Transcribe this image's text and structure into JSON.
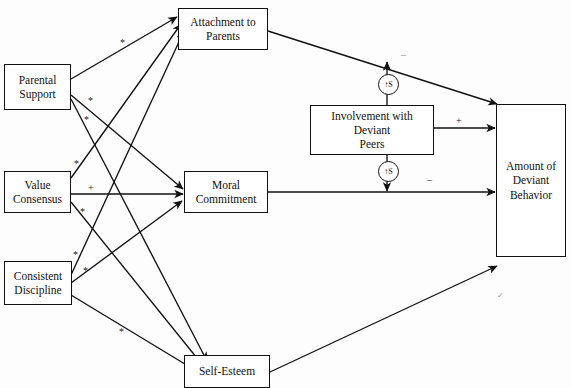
{
  "diagram": {
    "nodes": [
      {
        "id": "parental-support",
        "label": "Parental\nSupport"
      },
      {
        "id": "value-consensus",
        "label": "Value\nConsensus"
      },
      {
        "id": "consistent-discipline",
        "label": "Consistent\nDiscipline"
      },
      {
        "id": "attachment-to-parents",
        "label": "Attachment to\nParents"
      },
      {
        "id": "moral-commitment",
        "label": "Moral\nCommitment"
      },
      {
        "id": "self-esteem",
        "label": "Self-Esteem"
      },
      {
        "id": "involvement-deviant-peers",
        "label": "Involvement with\nDeviant\nPeers"
      },
      {
        "id": "amount-deviant-behavior",
        "label": "Amount of\nDeviant\nBehavior"
      }
    ],
    "edge_labels": [
      {
        "id": "ps-attachment",
        "text": "*"
      },
      {
        "id": "ps-moral",
        "text": "*"
      },
      {
        "id": "ps-selfesteem",
        "text": "*"
      },
      {
        "id": "vc-attachment",
        "text": "*"
      },
      {
        "id": "vc-moral",
        "text": "+"
      },
      {
        "id": "vc-selfesteem",
        "text": "*"
      },
      {
        "id": "cd-attachment",
        "text": "*"
      },
      {
        "id": "cd-moral",
        "text": "*"
      },
      {
        "id": "cd-selfesteem",
        "text": "*"
      },
      {
        "id": "attachment-deviant",
        "text": "–"
      },
      {
        "id": "peers-deviant",
        "text": "+"
      },
      {
        "id": "moral-deviant",
        "text": "–"
      },
      {
        "id": "selfesteem-deviant",
        "text": "✓"
      }
    ],
    "badges": [
      {
        "id": "badge-top",
        "text": "↑S"
      },
      {
        "id": "badge-bottom",
        "text": "↑S"
      }
    ],
    "colors": {
      "stroke": "#111111",
      "background": "#ffffff",
      "faint": "#8d8d8d"
    }
  }
}
